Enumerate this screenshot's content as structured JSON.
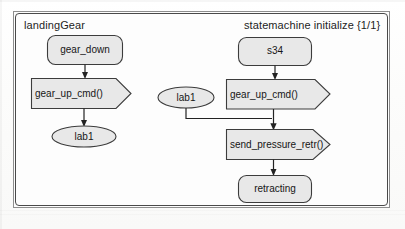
{
  "diagram": {
    "type": "uml-state-machine",
    "frame_label_left": "landingGear",
    "frame_label_right": "statemachine initialize {1/1}",
    "colors": {
      "node_fill": "#e8e8e8",
      "node_stroke": "#3c3c3c",
      "frame_stroke": "#4a4a4a",
      "frame_outer_stroke": "#8e8e8e",
      "text": "#161616",
      "connector": "#232323",
      "background": "#fdfdfc"
    },
    "left_column": {
      "title": "landingGear",
      "nodes": [
        {
          "id": "gear_down",
          "label": "gear_down",
          "shape": "rounded-rect",
          "kind": "state"
        },
        {
          "id": "gear_up_cmd_l",
          "label": "gear_up_cmd()",
          "shape": "pentagon-concave-right",
          "kind": "signal-receipt"
        },
        {
          "id": "lab1_left",
          "label": "lab1",
          "shape": "ellipse",
          "kind": "label-connector"
        }
      ],
      "connectors": [
        {
          "from": "gear_down",
          "to": "gear_up_cmd_l",
          "style": "arrow-down"
        },
        {
          "from": "gear_up_cmd_l",
          "to": "lab1_left",
          "style": "arrow-down"
        }
      ]
    },
    "right_column": {
      "title": "statemachine initialize {1/1}",
      "nodes": [
        {
          "id": "s34",
          "label": "s34",
          "shape": "rounded-rect",
          "kind": "state"
        },
        {
          "id": "gear_up_cmd_r",
          "label": "gear_up_cmd()",
          "shape": "pentagon-concave-right",
          "kind": "signal-receipt"
        },
        {
          "id": "send_pressure_retr",
          "label": "send_pressure_retr()",
          "shape": "pentagon-convex-right",
          "kind": "signal-send"
        },
        {
          "id": "retracting",
          "label": "retracting",
          "shape": "rounded-rect",
          "kind": "state"
        },
        {
          "id": "lab1_right",
          "label": "lab1",
          "shape": "ellipse",
          "kind": "label-connector"
        }
      ],
      "connectors": [
        {
          "from": "s34",
          "to": "gear_up_cmd_r",
          "style": "arrow-down"
        },
        {
          "from": "gear_up_cmd_r",
          "to": "send_pressure_retr",
          "style": "arrow-down"
        },
        {
          "from": "send_pressure_retr",
          "to": "retracting",
          "style": "arrow-down"
        },
        {
          "from": "lab1_right",
          "to": "send_pressure_retr",
          "style": "elbow-down-right"
        }
      ]
    }
  }
}
